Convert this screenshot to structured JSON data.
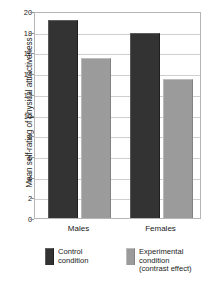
{
  "chart_data": {
    "type": "bar",
    "title": "",
    "xlabel": "",
    "ylabel": "Mean self-rating of physical attractiveness",
    "categories": [
      "Males",
      "Females"
    ],
    "series": [
      {
        "name": "Control condition",
        "color": "#333333",
        "values": [
          19.1,
          17.9
        ]
      },
      {
        "name": "Experimental condition (contrast effect)",
        "color": "#9b9b9b",
        "values": [
          15.5,
          13.4
        ]
      }
    ],
    "ylim": [
      0,
      20
    ],
    "yticks": [
      20,
      18,
      16,
      14,
      12,
      10,
      8,
      6,
      4,
      2,
      0
    ],
    "ytick_labels": [
      "20",
      "18",
      "16",
      "14",
      "12",
      "10",
      "8",
      "6",
      "4",
      "2",
      "0"
    ],
    "grid": "horizontal",
    "legend_position": "bottom",
    "legend": [
      {
        "label_lines": [
          "Control",
          "condition"
        ],
        "color": "#333333"
      },
      {
        "label_lines": [
          "Experimental",
          "condition",
          "(contrast effect)"
        ],
        "color": "#9b9b9b"
      }
    ]
  },
  "colors": {
    "control": "#333333",
    "experimental": "#9b9b9b",
    "frame": "#b5b5b5",
    "gridline": "#cfcfcf",
    "text": "#1a1a1a",
    "background": "#ffffff"
  }
}
